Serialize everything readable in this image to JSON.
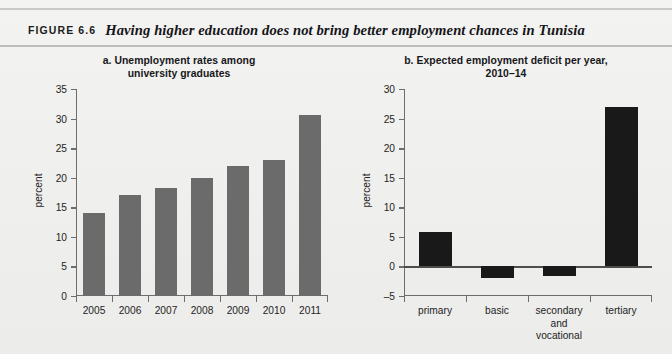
{
  "header": {
    "figure_number": "FIGURE 6.6",
    "title": "Having higher education does not bring better employment chances in Tunisia"
  },
  "colors": {
    "panel_a_bar": "#6b6b6b",
    "panel_b_bar": "#191919",
    "axis": "#6d6d6d",
    "background": "#f1f1ef",
    "text": "#1d1d1d"
  },
  "chart_data": [
    {
      "type": "bar",
      "panel": "a",
      "panel_label": "a.",
      "title": "Unemployment rates among university graduates",
      "title_line1": "Unemployment rates among",
      "title_line2": "university graduates",
      "xlabel": "",
      "ylabel": "percent",
      "ylim": [
        0,
        35
      ],
      "yticks": [
        0,
        5,
        10,
        15,
        20,
        25,
        30,
        35
      ],
      "grid": false,
      "legend": "none",
      "categories": [
        "2005",
        "2006",
        "2007",
        "2008",
        "2009",
        "2010",
        "2011"
      ],
      "values": [
        14.0,
        17.0,
        18.3,
        20.0,
        22.0,
        23.0,
        30.6
      ]
    },
    {
      "type": "bar",
      "panel": "b",
      "panel_label": "b.",
      "title": "Expected employment deficit per year, 2010–14",
      "title_line1": "Expected employment deficit per year,",
      "title_line2": "2010–14",
      "xlabel": "",
      "ylabel": "percent",
      "ylim": [
        -5,
        30
      ],
      "yticks": [
        -5,
        0,
        5,
        10,
        15,
        20,
        25,
        30
      ],
      "ytick_labels": [
        "–5",
        "0",
        "5",
        "10",
        "15",
        "20",
        "25",
        "30"
      ],
      "grid": false,
      "legend": "none",
      "categories": [
        "primary",
        "basic",
        "secondary and vocational",
        "tertiary"
      ],
      "category_lines": [
        [
          "primary"
        ],
        [
          "basic"
        ],
        [
          "secondary",
          "and",
          "vocational"
        ],
        [
          "tertiary"
        ]
      ],
      "values": [
        5.8,
        -2.0,
        -1.6,
        26.9
      ]
    }
  ]
}
